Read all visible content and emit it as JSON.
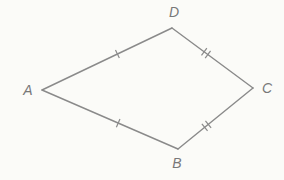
{
  "figure": {
    "background_color": "#fbfbf8",
    "line_color": "#8a8a8a",
    "tick_color": "#8a8a8a",
    "label_color": "#787878",
    "line_width": 1.4
  },
  "vertices": {
    "A": {
      "label": "A",
      "x": 42,
      "y": 90,
      "label_x": 28,
      "label_y": 91
    },
    "D": {
      "label": "D",
      "x": 172,
      "y": 28,
      "label_x": 174,
      "label_y": 13
    },
    "C": {
      "label": "C",
      "x": 253,
      "y": 88,
      "label_x": 267,
      "label_y": 89
    },
    "B": {
      "label": "B",
      "x": 178,
      "y": 149,
      "label_x": 177,
      "label_y": 164
    }
  },
  "sides": [
    {
      "name": "AD",
      "from": "A",
      "to": "D",
      "tick_count": 1,
      "tick_t": 0.58
    },
    {
      "name": "DC",
      "from": "D",
      "to": "C",
      "tick_count": 2,
      "tick_t": 0.42
    },
    {
      "name": "AB",
      "from": "A",
      "to": "B",
      "tick_count": 1,
      "tick_t": 0.56
    },
    {
      "name": "BC",
      "from": "B",
      "to": "C",
      "tick_count": 2,
      "tick_t": 0.38
    }
  ],
  "congruences": [
    {
      "pair": "AD ≅ AB",
      "ticks": 1
    },
    {
      "pair": "DC ≅ BC",
      "ticks": 2
    }
  ]
}
